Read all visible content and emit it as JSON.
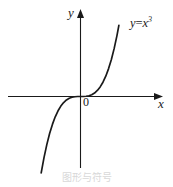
{
  "figure": {
    "background_color": "#ffffff",
    "stroke_color": "#1a1a1a",
    "caption": "图形与符号"
  },
  "labels": {
    "y_axis": "y",
    "x_axis": "x",
    "origin": "0",
    "curve_base": "y",
    "curve_equals": "=",
    "curve_variable": "x",
    "curve_exponent": "3",
    "curve_full": "y=x³"
  },
  "chart_data": {
    "type": "line",
    "title": "",
    "subtitle": "",
    "xlabel": "x",
    "ylabel": "y",
    "equation": "y = x^3",
    "legend": [
      "y=x³"
    ],
    "legend_position": "upper-right-inline",
    "grid": false,
    "annotations": [
      {
        "text": "0",
        "role": "origin-label",
        "x": 0,
        "y": 0
      },
      {
        "text": "y=x³",
        "role": "curve-label",
        "x": 2.1,
        "y": 8.0
      },
      {
        "text": "y",
        "role": "y-axis-tip-label"
      },
      {
        "text": "x",
        "role": "x-axis-tip-label"
      }
    ],
    "xlim": [
      -2.4,
      2.6
    ],
    "ylim": [
      -9.5,
      9.5
    ],
    "axes": {
      "x_axis_y": 0,
      "y_axis_x": 0,
      "x_arrow": true,
      "y_arrow": true,
      "ticks": [],
      "tick_labels": []
    },
    "series": [
      {
        "name": "y=x³",
        "color": "#1a1a1a",
        "x": [
          -2.1,
          -1.95,
          -1.8,
          -1.65,
          -1.5,
          -1.35,
          -1.2,
          -1.05,
          -0.9,
          -0.75,
          -0.6,
          -0.45,
          -0.3,
          -0.15,
          0.0,
          0.15,
          0.3,
          0.45,
          0.6,
          0.75,
          0.9,
          1.05,
          1.2,
          1.35,
          1.5,
          1.65,
          1.8,
          1.95,
          2.05
        ],
        "values": [
          -9.26,
          -7.41,
          -5.83,
          -4.49,
          -3.38,
          -2.46,
          -1.73,
          -1.16,
          -0.73,
          -0.42,
          -0.22,
          -0.09,
          -0.03,
          -0.003,
          0.0,
          0.003,
          0.03,
          0.09,
          0.22,
          0.42,
          0.73,
          1.16,
          1.73,
          2.46,
          3.38,
          4.49,
          5.83,
          7.41,
          8.62
        ]
      }
    ]
  }
}
